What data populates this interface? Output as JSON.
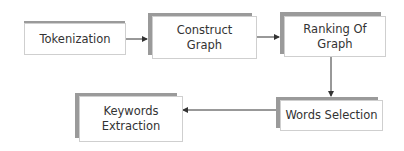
{
  "diagram": {
    "type": "flowchart",
    "nodes": [
      {
        "id": "tokenization",
        "label": "Tokenization"
      },
      {
        "id": "construct-graph",
        "label": "Construct Graph",
        "lines": [
          "Construct",
          "Graph"
        ]
      },
      {
        "id": "ranking-of-graph",
        "label": "Ranking Of Graph",
        "lines": [
          "Ranking Of",
          "Graph"
        ]
      },
      {
        "id": "words-selection",
        "label": "Words Selection"
      },
      {
        "id": "keywords-extraction",
        "label": "Keywords Extraction",
        "lines": [
          "Keywords",
          "Extraction"
        ]
      }
    ],
    "edges": [
      {
        "from": "tokenization",
        "to": "construct-graph"
      },
      {
        "from": "construct-graph",
        "to": "ranking-of-graph"
      },
      {
        "from": "ranking-of-graph",
        "to": "words-selection"
      },
      {
        "from": "words-selection",
        "to": "keywords-extraction"
      }
    ],
    "colors": {
      "shadow": "#9a9a9a",
      "border": "#cfcfcf",
      "arrow": "#333333",
      "text": "#333333"
    }
  }
}
